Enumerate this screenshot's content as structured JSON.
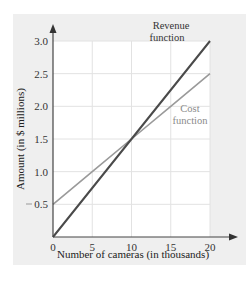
{
  "chart_data": {
    "type": "line",
    "title": "",
    "xlabel": "Number of cameras (in thousands)",
    "ylabel": "Amount (in $ millions)",
    "xlim": [
      0,
      20
    ],
    "ylim": [
      0,
      3.0
    ],
    "x_ticks": [
      "0",
      "5",
      "10",
      "15",
      "20"
    ],
    "y_ticks": [
      "0.5",
      "1.0",
      "1.5",
      "2.0",
      "2.5",
      "3.0"
    ],
    "grid": true,
    "legend": "inline annotations",
    "series": [
      {
        "name": "Revenue function",
        "color": "#4a4a4a",
        "x": [
          0,
          5,
          10,
          15,
          20
        ],
        "values": [
          0,
          0.75,
          1.5,
          2.25,
          3.0
        ]
      },
      {
        "name": "Cost function",
        "color": "#9a9a9a",
        "x": [
          0,
          5,
          10,
          15,
          20
        ],
        "values": [
          0.5,
          1.0,
          1.5,
          2.0,
          2.5
        ]
      }
    ],
    "annotations": [
      {
        "text_lines": [
          "Revenue",
          "function"
        ],
        "series": "Revenue function"
      },
      {
        "text_lines": [
          "Cost",
          "function"
        ],
        "series": "Cost function"
      }
    ]
  },
  "labels": {
    "revenue_line1": "Revenue",
    "revenue_line2": "function",
    "cost_line1": "Cost",
    "cost_line2": "function"
  },
  "colors": {
    "panel_bg": "#efefef",
    "plot_bg": "#ffffff",
    "grid": "#e2e2e2",
    "axis": "#444444"
  }
}
